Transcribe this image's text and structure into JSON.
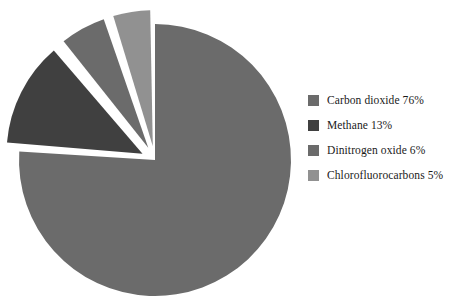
{
  "chart_data": {
    "type": "pie",
    "title": "",
    "labels": [
      "Carbon dioxide",
      "Methane",
      "Dinitrogen oxide",
      "Chlorofluorocarbons"
    ],
    "values": [
      76,
      13,
      6,
      5
    ],
    "value_unit": "%",
    "legend_entries": [
      "Carbon dioxide 76%",
      "Methane 13%",
      "Dinitrogen oxide 6%",
      "Chlorofluorocarbons 5%"
    ],
    "colors": [
      "#6b6b6b",
      "#404040",
      "#6b6b6b",
      "#919191"
    ],
    "exploded": [
      false,
      true,
      true,
      true
    ],
    "legend_position": "right",
    "grid": false,
    "start_angle_deg": 0,
    "direction": "clockwise",
    "background": "#ffffff"
  },
  "legend": {
    "items": [
      {
        "label": "Carbon dioxide 76%",
        "color": "#6b6b6b",
        "swatch_name": "legend-swatch-carbon-dioxide"
      },
      {
        "label": "Methane 13%",
        "color": "#404040",
        "swatch_name": "legend-swatch-methane"
      },
      {
        "label": "Dinitrogen oxide 6%",
        "color": "#6b6b6b",
        "swatch_name": "legend-swatch-dinitrogen-oxide"
      },
      {
        "label": "Chlorofluorocarbons 5%",
        "color": "#919191",
        "swatch_name": "legend-swatch-chlorofluorocarbons"
      }
    ]
  },
  "pie": {
    "center_x": 155,
    "center_y": 160,
    "radius": 136,
    "explode_offset": 14,
    "gap_deg": 2.2
  }
}
